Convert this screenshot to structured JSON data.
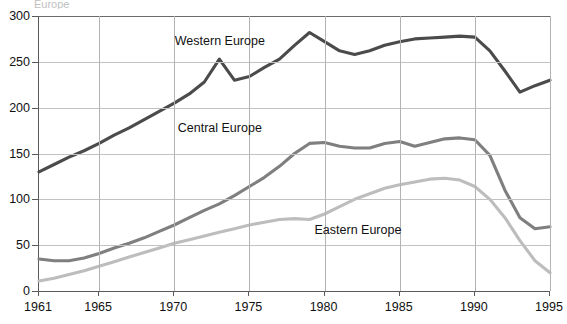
{
  "title_remnant": "Europe",
  "chart_data": {
    "type": "line",
    "title": "",
    "xlabel": "",
    "ylabel": "",
    "xlim": [
      1961,
      1995
    ],
    "ylim": [
      0,
      300
    ],
    "grid": true,
    "legend_position": "inline-annotations",
    "x": [
      1961,
      1962,
      1963,
      1964,
      1965,
      1966,
      1967,
      1968,
      1969,
      1970,
      1971,
      1972,
      1973,
      1974,
      1975,
      1976,
      1977,
      1978,
      1979,
      1980,
      1981,
      1982,
      1983,
      1984,
      1985,
      1986,
      1987,
      1988,
      1989,
      1990,
      1991,
      1992,
      1993,
      1994,
      1995
    ],
    "ytick_labels": [
      "0",
      "50",
      "100",
      "150",
      "200",
      "250",
      "300"
    ],
    "ytick_values": [
      0,
      50,
      100,
      150,
      200,
      250,
      300
    ],
    "xtick_labels": [
      "1961",
      "1965",
      "1970",
      "1975",
      "1980",
      "1985",
      "1990",
      "1995"
    ],
    "xtick_values": [
      1961,
      1965,
      1970,
      1975,
      1980,
      1985,
      1990,
      1995
    ],
    "series": [
      {
        "name": "Western Europe",
        "color": "#4b4b4b",
        "label_x": 1970.1,
        "label_y": 272,
        "values": [
          130,
          138,
          146,
          153,
          161,
          170,
          178,
          187,
          196,
          205,
          215,
          228,
          253,
          230,
          234,
          244,
          253,
          268,
          282,
          272,
          262,
          258,
          262,
          268,
          272,
          275,
          276,
          277,
          278,
          277,
          262,
          240,
          217,
          224,
          230
        ]
      },
      {
        "name": "Central Europe",
        "color": "#7f7f7f",
        "label_x": 1970.3,
        "label_y": 177,
        "values": [
          35,
          33,
          33,
          36,
          41,
          47,
          52,
          58,
          65,
          72,
          80,
          88,
          95,
          104,
          114,
          124,
          136,
          150,
          161,
          162,
          158,
          156,
          156,
          161,
          163,
          158,
          162,
          166,
          167,
          165,
          148,
          110,
          80,
          68,
          70
        ]
      },
      {
        "name": "Eastern Europe",
        "color": "#bdbdbd",
        "label_x": 1979.4,
        "label_y": 65,
        "values": [
          11,
          14,
          18,
          22,
          27,
          32,
          37,
          42,
          47,
          52,
          56,
          60,
          64,
          68,
          72,
          75,
          78,
          79,
          78,
          84,
          92,
          100,
          106,
          112,
          116,
          119,
          122,
          123,
          121,
          114,
          100,
          80,
          55,
          33,
          20
        ]
      }
    ]
  }
}
